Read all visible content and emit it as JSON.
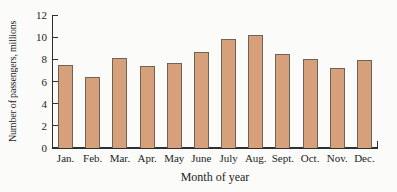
{
  "chart_data": {
    "type": "bar",
    "title": "",
    "xlabel": "Month of year",
    "ylabel": "Number of passengers, millions",
    "categories": [
      "Jan.",
      "Feb.",
      "Mar.",
      "Apr.",
      "May",
      "June",
      "July",
      "Aug.",
      "Sept.",
      "Oct.",
      "Nov.",
      "Dec."
    ],
    "values": [
      7.5,
      6.4,
      8.1,
      7.4,
      7.7,
      8.7,
      9.8,
      10.2,
      8.5,
      8.0,
      7.2,
      7.9
    ],
    "ylim": [
      0,
      12
    ],
    "yticks": [
      0,
      2,
      4,
      6,
      8,
      10,
      12
    ],
    "grid": false,
    "legend": false,
    "bar_width_px": 15
  },
  "colors": {
    "bar_fill": "#d6a07a",
    "bar_border": "#6e6259",
    "axis": "#2f2f2f",
    "text": "#242424",
    "background": "#fbfbf9"
  }
}
